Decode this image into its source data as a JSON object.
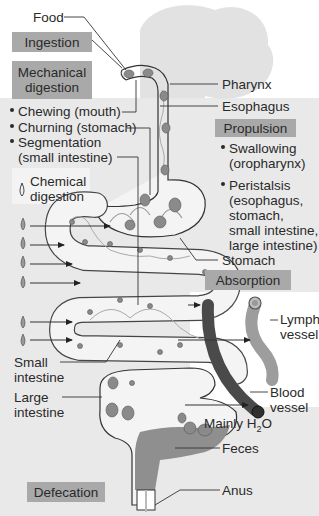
{
  "diagram": {
    "type": "digestive-system-process",
    "colors": {
      "panel_gray": "#e9e9e9",
      "box_fill": "#a9a9a9",
      "tract_fill": "#f4f4f4",
      "food_particle": "#8a8a8a",
      "blood_vessel": "#4a4a4a",
      "lymph_vessel": "#9d9d9d",
      "feces": "#8f8f8f",
      "head_silhouette": "#e4e4e4"
    },
    "process_boxes": {
      "ingestion": "Ingestion",
      "mechanical_digestion": [
        "Mechanical",
        "digestion"
      ],
      "propulsion": "Propulsion",
      "chemical_digestion": [
        "Chemical",
        "digestion"
      ],
      "absorption": "Absorption",
      "defecation": "Defecation"
    },
    "mechanical_list": [
      "Chewing (mouth)",
      "Churning (stomach)",
      "Segmentation",
      "(small intestine)"
    ],
    "propulsion_list": [
      {
        "lines": [
          "Swallowing",
          "(oropharynx)"
        ]
      },
      {
        "lines": [
          "Peristalsis",
          "(esophagus,",
          "stomach,",
          "small intestine,",
          "large intestine)"
        ]
      }
    ],
    "anatomy_labels": {
      "food": "Food",
      "pharynx": "Pharynx",
      "esophagus": "Esophagus",
      "stomach": "Stomach",
      "lymph_vessel": [
        "Lymph",
        "vessel"
      ],
      "blood_vessel": [
        "Blood",
        "vessel"
      ],
      "small_intestine": [
        "Small",
        "intestine"
      ],
      "large_intestine": [
        "Large",
        "intestine"
      ],
      "mainly_h2o_prefix": "Mainly H",
      "mainly_h2o_sub": "2",
      "mainly_h2o_suffix": "O",
      "feces": "Feces",
      "anus": "Anus"
    },
    "enzyme_drops_count": 6
  }
}
